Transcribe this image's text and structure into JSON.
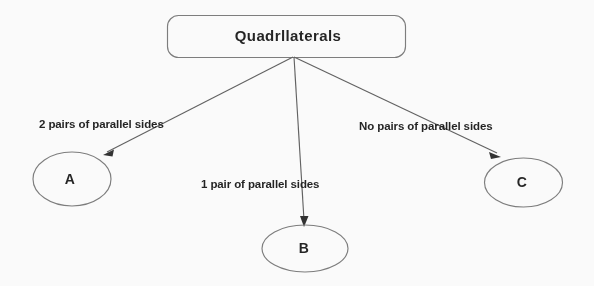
{
  "diagram": {
    "title": "Quadrllaterals",
    "root": {
      "label": "Quadrlaterals",
      "label_rendered": "Quadrllaterals"
    },
    "branches": [
      {
        "edge_label": "2 pairs of parallel sides",
        "node_label": "A"
      },
      {
        "edge_label": "1 pair of parallel sides",
        "node_label": "B"
      },
      {
        "edge_label": "No pairs of parallel sides",
        "node_label": "C"
      }
    ],
    "colors": {
      "background": "#ffffff",
      "shape_stroke": "#7a7a7a",
      "connector": "#5d5d5d",
      "text": "#1c1c1c"
    }
  }
}
